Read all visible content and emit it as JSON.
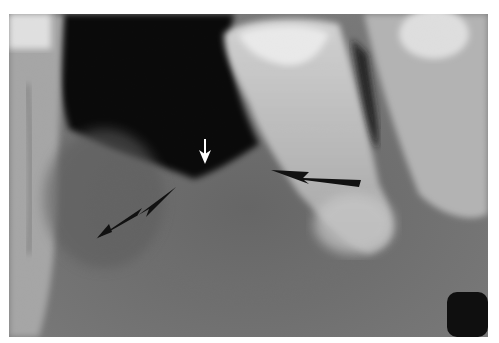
{
  "figure": {
    "type": "dental-radiograph",
    "background": "#ffffff",
    "film_colors": {
      "air": "#050505",
      "bone": "#6e6e6e",
      "tooth": "#cfcfcf",
      "restoration": "#f2f2f2"
    },
    "annotations": [
      {
        "id": "white-arrow-down",
        "color": "#ffffff",
        "direction": "down"
      },
      {
        "id": "black-arrow-left",
        "color": "#111111",
        "direction": "up-right"
      },
      {
        "id": "black-arrow-right",
        "color": "#111111",
        "direction": "left"
      }
    ]
  }
}
